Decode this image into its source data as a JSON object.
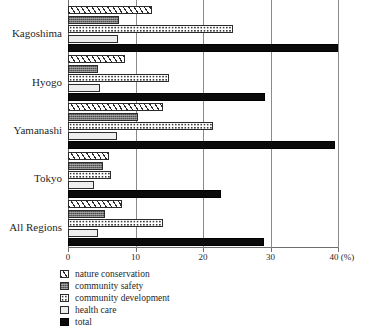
{
  "chart_data": {
    "type": "bar",
    "orientation": "horizontal",
    "title": "",
    "xlabel": "(%)",
    "ylabel": "",
    "xlim": [
      0,
      40
    ],
    "xticks": [
      0,
      10,
      20,
      30,
      40
    ],
    "xtick_labels": [
      "0",
      "10",
      "20",
      "30",
      "40 (%)"
    ],
    "grid": true,
    "legend_position": "bottom-left",
    "categories": [
      "Kagoshima",
      "Hyogo",
      "Yamanashi",
      "Tokyo",
      "All Regions"
    ],
    "series": [
      {
        "name": "nature conservation",
        "key": "nature",
        "values": [
          12.5,
          8.5,
          14.0,
          6.0,
          8.0
        ]
      },
      {
        "name": "community safety",
        "key": "safety",
        "values": [
          7.5,
          4.5,
          10.3,
          5.2,
          5.5
        ]
      },
      {
        "name": "community development",
        "key": "development",
        "values": [
          24.5,
          15.0,
          21.5,
          6.3,
          14.0
        ]
      },
      {
        "name": "health care",
        "key": "health",
        "values": [
          7.4,
          4.8,
          7.3,
          3.8,
          4.5
        ]
      },
      {
        "name": "total",
        "key": "total",
        "values": [
          40.0,
          29.2,
          39.5,
          22.7,
          29.0
        ]
      }
    ]
  },
  "axis": {
    "tick_labels": [
      "0",
      "10",
      "20",
      "30",
      "40 (%)"
    ],
    "tick_values": [
      0,
      10,
      20,
      30,
      40
    ]
  },
  "categories": {
    "c0": "Kagoshima",
    "c1": "Hyogo",
    "c2": "Yamanashi",
    "c3": "Tokyo",
    "c4": "All Regions"
  },
  "legend": {
    "items": [
      {
        "label": "nature conservation",
        "pattern": "diagonal-hatch",
        "color": "#ffffff"
      },
      {
        "label": "community safety",
        "pattern": "solid-gray",
        "color": "#707070"
      },
      {
        "label": "community development",
        "pattern": "dotted",
        "color": "#ffffff"
      },
      {
        "label": "health care",
        "pattern": "light-solid",
        "color": "#eeeeee"
      },
      {
        "label": "total",
        "pattern": "solid-black",
        "color": "#0b0b0b"
      }
    ]
  },
  "colors": {
    "gridline": "#8a8a8a",
    "axis": "#6e6e6e",
    "bar_outline": "#2b2b2b",
    "total_fill": "#0b0b0b",
    "safety_fill": "#707070",
    "health_fill": "#eeeeee",
    "background": "#ffffff"
  }
}
